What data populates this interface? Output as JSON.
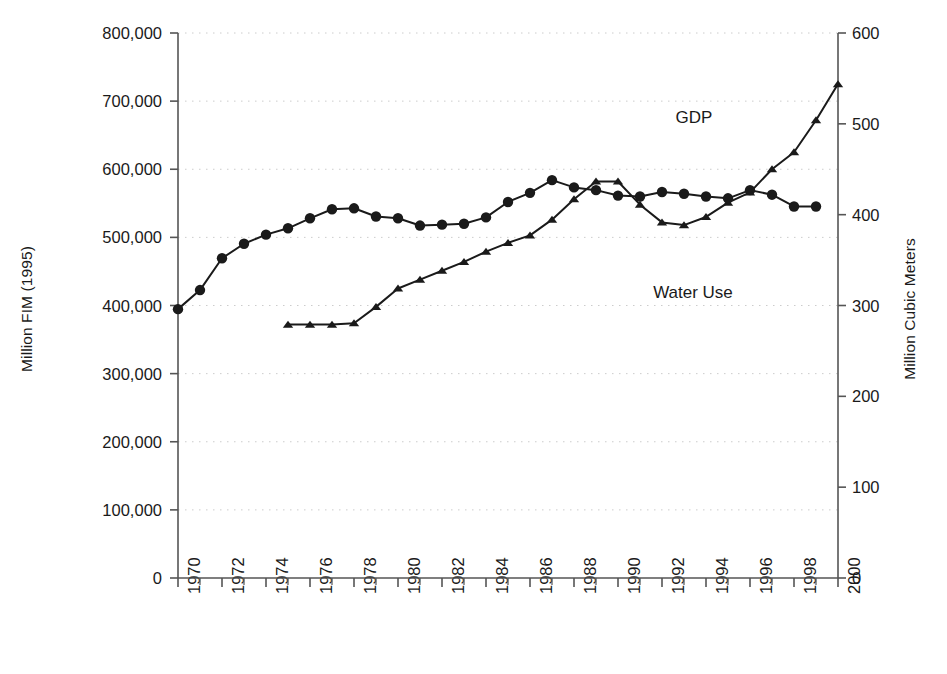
{
  "chart_data": {
    "type": "line",
    "title": "",
    "xlabel": "",
    "ylabel": "Million FIM (1995)",
    "y2label": "Million Cubic Meters",
    "grid": true,
    "legend_position": "inline-annotations",
    "x": [
      1970,
      1971,
      1972,
      1973,
      1974,
      1975,
      1976,
      1977,
      1978,
      1979,
      1980,
      1981,
      1982,
      1983,
      1984,
      1985,
      1986,
      1987,
      1988,
      1989,
      1990,
      1991,
      1992,
      1993,
      1994,
      1995,
      1996,
      1997,
      1998,
      1999,
      2000
    ],
    "xlim": [
      1970,
      2000
    ],
    "xticklabels": [
      "1970",
      "1972",
      "1974",
      "1976",
      "1978",
      "1980",
      "1982",
      "1984",
      "1986",
      "1988",
      "1990",
      "1992",
      "1994",
      "1996",
      "1998",
      "2000"
    ],
    "xtickvalues": [
      1970,
      1972,
      1974,
      1976,
      1978,
      1980,
      1982,
      1984,
      1986,
      1988,
      1990,
      1992,
      1994,
      1996,
      1998,
      2000
    ],
    "ylim": [
      0,
      800000
    ],
    "yticklabels": [
      "0",
      "100,000",
      "200,000",
      "300,000",
      "400,000",
      "500,000",
      "600,000",
      "700,000",
      "800,000"
    ],
    "ytickvalues": [
      0,
      100000,
      200000,
      300000,
      400000,
      500000,
      600000,
      700000,
      800000
    ],
    "y2lim": [
      0,
      600
    ],
    "y2ticklabels": [
      "0",
      "100",
      "200",
      "300",
      "400",
      "500",
      "600"
    ],
    "y2tickvalues": [
      0,
      100,
      200,
      300,
      400,
      500,
      600
    ],
    "series": [
      {
        "name": "Water Use",
        "axis": "right",
        "marker": "circle",
        "color": "#1a1a1a",
        "annotation": "Water Use",
        "x": [
          1970,
          1971,
          1972,
          1973,
          1974,
          1975,
          1976,
          1977,
          1978,
          1979,
          1980,
          1981,
          1982,
          1983,
          1984,
          1985,
          1986,
          1987,
          1988,
          1989,
          1990,
          1991,
          1992,
          1993,
          1994,
          1995,
          1996,
          1997,
          1998,
          1999
        ],
        "values": [
          296,
          317,
          352,
          368,
          378,
          385,
          396,
          406,
          407,
          398,
          396,
          388,
          389,
          390,
          397,
          414,
          424,
          438,
          430,
          427,
          421,
          420,
          425,
          423,
          420,
          418,
          427,
          422,
          409,
          409
        ]
      },
      {
        "name": "GDP",
        "axis": "left",
        "marker": "triangle",
        "color": "#1a1a1a",
        "annotation": "GDP",
        "x": [
          1975,
          1976,
          1977,
          1978,
          1979,
          1980,
          1981,
          1982,
          1983,
          1984,
          1985,
          1986,
          1987,
          1988,
          1989,
          1990,
          1991,
          1992,
          1993,
          1994,
          1995,
          1996,
          1997,
          1998,
          1999,
          2000
        ],
        "values": [
          372000,
          372000,
          372000,
          374000,
          398000,
          425000,
          438000,
          451000,
          464000,
          479000,
          492000,
          503000,
          526000,
          556000,
          582000,
          582000,
          548000,
          522000,
          518000,
          530000,
          551000,
          566000,
          600000,
          625000,
          672000,
          725000
        ]
      }
    ]
  },
  "axes": {
    "left_title": "Million FIM (1995)",
    "right_title": "Million Cubic Meters"
  },
  "annotations": {
    "gdp": "GDP",
    "water_use": "Water Use"
  }
}
